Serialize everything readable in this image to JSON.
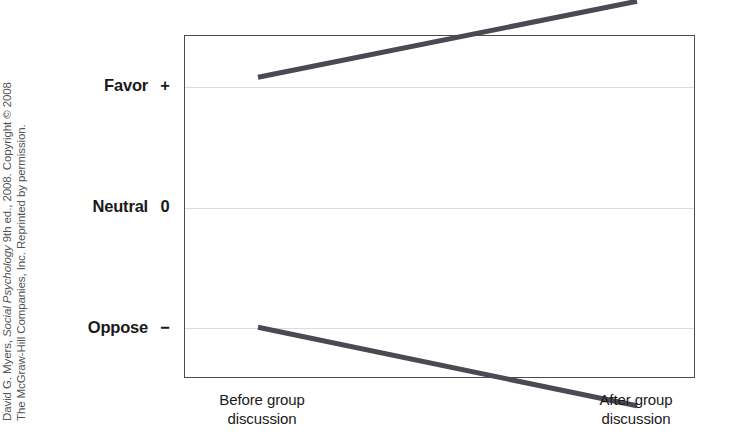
{
  "credit": {
    "line1_prefix": "David G. Myers, ",
    "line1_italic": "Social Psychology",
    "line1_suffix": " 9th ed., 2008. Copyright © 2008",
    "line2": "The McGraw-Hill Companies, Inc. Reprinted by permission."
  },
  "chart_data": {
    "type": "line",
    "title": "",
    "subtitle": "",
    "xlabel": "",
    "ylabel": "",
    "categories": [
      "Before group discussion",
      "After group discussion"
    ],
    "x_tick_labels": [
      {
        "line1": "Before group",
        "line2": "discussion"
      },
      {
        "line1": "After group",
        "line2": "discussion"
      }
    ],
    "y_tick_labels": [
      {
        "name": "Favor",
        "symbol": "+",
        "value": 1
      },
      {
        "name": "Neutral",
        "symbol": "0",
        "value": 0
      },
      {
        "name": "Oppose",
        "symbol": "−",
        "value": -1
      }
    ],
    "ylim": [
      -1.42,
      1.42
    ],
    "grid": true,
    "grid_color": "#dcdcdc",
    "legend": "none",
    "line_color": "#4a4a52",
    "line_width": 5,
    "frame_color": "#4b4b4b",
    "series": [
      {
        "name": "Group initially favoring",
        "values": [
          1.07,
          1.7
        ],
        "x": [
          "Before group discussion",
          "After group discussion"
        ]
      },
      {
        "name": "Group initially opposing",
        "values": [
          -1.0,
          -1.65
        ],
        "x": [
          "Before group discussion",
          "After group discussion"
        ]
      }
    ]
  }
}
